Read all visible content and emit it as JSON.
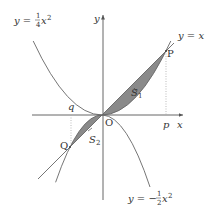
{
  "diagram": {
    "title": "",
    "colors": {
      "axis": "#555555",
      "curve": "#666666",
      "shade": "#8a8a8a",
      "dotted": "#aaaaaa",
      "text": "#333333"
    },
    "axes": {
      "x_label": "x",
      "y_label": "y"
    },
    "origin_label": "O",
    "points": [
      {
        "name": "P",
        "coords": [
          4,
          4
        ]
      },
      {
        "name": "Q",
        "coords": [
          -2,
          -2
        ]
      }
    ],
    "tick_labels": {
      "p": "p",
      "q": "q"
    },
    "curves": [
      {
        "id": "upper-parabola",
        "label_lhs": "y = ",
        "label_num": "1",
        "label_den": "4",
        "label_rhs": "x",
        "label_exp": "2",
        "equation": "y = 1/4 x^2"
      },
      {
        "id": "lower-parabola",
        "label_lhs": "y = −",
        "label_num": "1",
        "label_den": "2",
        "label_rhs": "x",
        "label_exp": "2",
        "equation": "y = -1/2 x^2"
      },
      {
        "id": "line",
        "label": "y = x",
        "equation": "y = x"
      }
    ],
    "regions": [
      {
        "name": "S",
        "sub": "1",
        "between": [
          "y = x",
          "y = 1/4 x^2"
        ],
        "x_range": [
          0,
          4
        ]
      },
      {
        "name": "S",
        "sub": "2",
        "between": [
          "y = x",
          "y = -1/2 x^2"
        ],
        "x_range": [
          -2,
          0
        ]
      }
    ]
  }
}
